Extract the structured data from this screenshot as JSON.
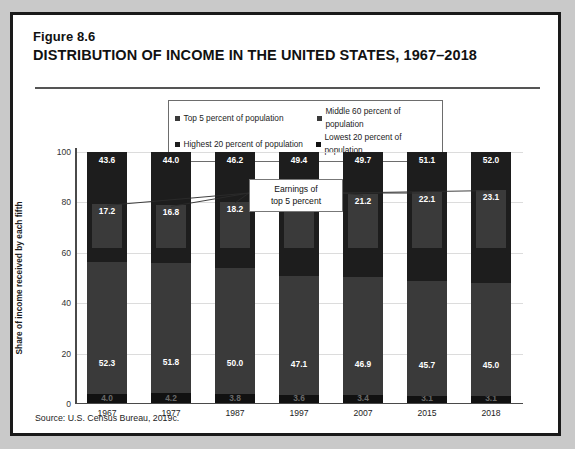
{
  "figure": {
    "number": "Figure 8.6",
    "title": "DISTRIBUTION OF INCOME IN THE UNITED STATES, 1967–2018",
    "source": "Source:  U.S. Census Bureau, 2019c."
  },
  "legend": {
    "items": [
      {
        "label": "Top 5 percent of population",
        "color": "#3a3a3a"
      },
      {
        "label": "Middle 60 percent of population",
        "color": "#3a3a3a"
      },
      {
        "label": "Highest 20 percent of population",
        "color": "#1d1d1d"
      },
      {
        "label": "Lowest 20 percent of population",
        "color": "#111111"
      }
    ]
  },
  "callout": {
    "line1": "Earnings of",
    "line2": "top 5 percent"
  },
  "chart_data": {
    "type": "bar",
    "title": "DISTRIBUTION OF INCOME IN THE UNITED STATES, 1967–2018",
    "xlabel": "",
    "ylabel": "Share of income received by each fifth",
    "ylim": [
      0,
      100
    ],
    "yticks": [
      0,
      20,
      40,
      60,
      80,
      100
    ],
    "ytick_labels": [
      "0",
      "20",
      "40",
      "60",
      "80",
      "100"
    ],
    "grid": true,
    "legend_position": "top-center",
    "stacked": true,
    "categories": [
      "1967",
      "1977",
      "1987",
      "1997",
      "2007",
      "2015",
      "2018"
    ],
    "series": [
      {
        "name": "Highest 20 percent of population",
        "values": [
          43.6,
          44.0,
          46.2,
          49.4,
          49.7,
          51.1,
          52.0
        ]
      },
      {
        "name": "Middle 60 percent of population",
        "values": [
          52.3,
          51.8,
          50.0,
          47.1,
          46.9,
          45.7,
          45.0
        ]
      },
      {
        "name": "Lowest 20 percent of population",
        "values": [
          4.0,
          4.2,
          3.8,
          3.6,
          3.4,
          3.1,
          3.1
        ]
      },
      {
        "name": "Top 5 percent of population",
        "values": [
          17.2,
          16.8,
          18.2,
          21.7,
          21.2,
          22.1,
          23.1
        ]
      }
    ],
    "annotations": [
      {
        "text": "Earnings of top 5 percent",
        "points_to": "Top 5 percent of population"
      }
    ]
  }
}
